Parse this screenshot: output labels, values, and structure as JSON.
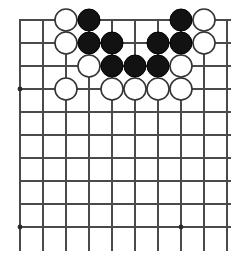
{
  "diagram": {
    "type": "go-board",
    "board": {
      "visible_columns": 10,
      "visible_rows": 10,
      "origin_x": 20,
      "origin_y": 20,
      "cell_size": 23,
      "line_color": "#4a4a4a",
      "background_color": "#ffffff",
      "stone_radius": 11,
      "black_color": "#121212",
      "white_color": "#ffffff"
    },
    "star_points": [
      {
        "col": 0,
        "row": 3
      },
      {
        "col": 0,
        "row": 9
      },
      {
        "col": 7,
        "row": 9
      }
    ],
    "stones": [
      {
        "col": 2,
        "row": 0,
        "color": "white"
      },
      {
        "col": 3,
        "row": 0,
        "color": "black"
      },
      {
        "col": 7,
        "row": 0,
        "color": "black"
      },
      {
        "col": 8,
        "row": 0,
        "color": "white"
      },
      {
        "col": 2,
        "row": 1,
        "color": "white"
      },
      {
        "col": 3,
        "row": 1,
        "color": "black"
      },
      {
        "col": 4,
        "row": 1,
        "color": "black"
      },
      {
        "col": 6,
        "row": 1,
        "color": "black"
      },
      {
        "col": 7,
        "row": 1,
        "color": "black"
      },
      {
        "col": 8,
        "row": 1,
        "color": "white"
      },
      {
        "col": 3,
        "row": 2,
        "color": "white"
      },
      {
        "col": 4,
        "row": 2,
        "color": "black"
      },
      {
        "col": 5,
        "row": 2,
        "color": "black"
      },
      {
        "col": 6,
        "row": 2,
        "color": "black"
      },
      {
        "col": 7,
        "row": 2,
        "color": "white"
      },
      {
        "col": 2,
        "row": 3,
        "color": "white"
      },
      {
        "col": 4,
        "row": 3,
        "color": "white"
      },
      {
        "col": 5,
        "row": 3,
        "color": "white"
      },
      {
        "col": 6,
        "row": 3,
        "color": "white"
      },
      {
        "col": 7,
        "row": 3,
        "color": "white"
      }
    ]
  }
}
